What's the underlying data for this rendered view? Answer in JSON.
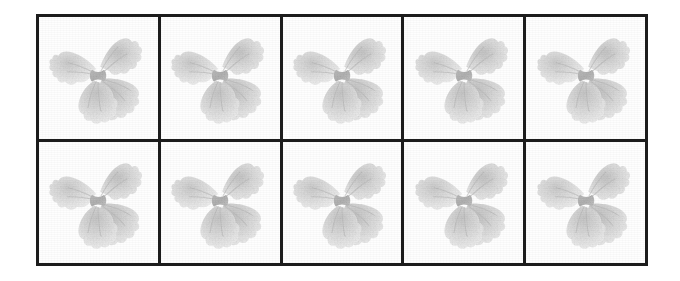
{
  "page": {
    "background_color": "#ffffff",
    "width": 680,
    "height": 281
  },
  "grid": {
    "name": "pasta-image-grid",
    "columns": 5,
    "rows": 2,
    "total_cells": 10,
    "border_color": "#1c1c1c",
    "border_width_px": 3,
    "cell_background_color": "#fefefe",
    "frame": {
      "left": 36,
      "top": 14,
      "width": 612,
      "height": 252
    }
  },
  "subject": {
    "name": "farfalle-pasta",
    "label": "Farfalle (bow-tie) pasta",
    "description": "Faded grayscale photograph of a single dry farfalle pasta piece with ruffled wing edges and a pinched center",
    "orientation": "wings upper-left and lower-right, pinched center",
    "tone_light": "#f1f1f1",
    "tone_mid": "#d8d8d8",
    "tone_dark": "#b3b3b3",
    "tone_shadow": "#9a9a9a"
  },
  "cells": [
    {
      "index": 1,
      "row": 1,
      "column": 1,
      "name": "pasta-cell-r1c1",
      "subject": "farfalle-pasta"
    },
    {
      "index": 2,
      "row": 1,
      "column": 2,
      "name": "pasta-cell-r1c2",
      "subject": "farfalle-pasta"
    },
    {
      "index": 3,
      "row": 1,
      "column": 3,
      "name": "pasta-cell-r1c3",
      "subject": "farfalle-pasta"
    },
    {
      "index": 4,
      "row": 1,
      "column": 4,
      "name": "pasta-cell-r1c4",
      "subject": "farfalle-pasta"
    },
    {
      "index": 5,
      "row": 1,
      "column": 5,
      "name": "pasta-cell-r1c5",
      "subject": "farfalle-pasta"
    },
    {
      "index": 6,
      "row": 2,
      "column": 1,
      "name": "pasta-cell-r2c1",
      "subject": "farfalle-pasta"
    },
    {
      "index": 7,
      "row": 2,
      "column": 2,
      "name": "pasta-cell-r2c2",
      "subject": "farfalle-pasta"
    },
    {
      "index": 8,
      "row": 2,
      "column": 3,
      "name": "pasta-cell-r2c3",
      "subject": "farfalle-pasta"
    },
    {
      "index": 9,
      "row": 2,
      "column": 4,
      "name": "pasta-cell-r2c4",
      "subject": "farfalle-pasta"
    },
    {
      "index": 10,
      "row": 2,
      "column": 5,
      "name": "pasta-cell-r2c5",
      "subject": "farfalle-pasta"
    }
  ]
}
